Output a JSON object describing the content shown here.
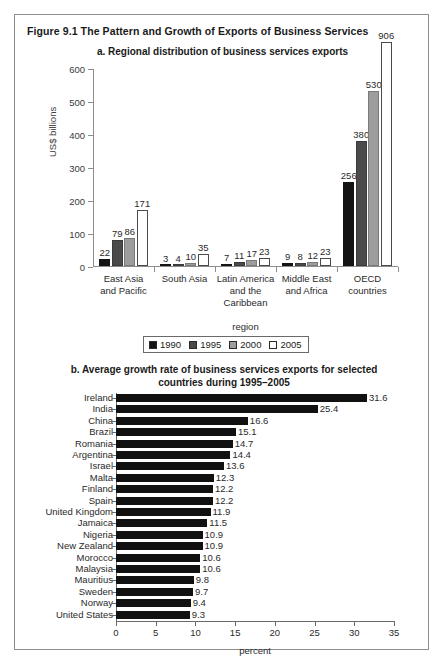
{
  "figure": {
    "title": "Figure 9.1  The Pattern and Growth of Exports of Business Services"
  },
  "panel_a": {
    "title": "a. Regional distribution of business services exports",
    "xlabel": "region",
    "legend": [
      {
        "label": "1990",
        "color": "#141414"
      },
      {
        "label": "1995",
        "color": "#4a4a4a"
      },
      {
        "label": "2000",
        "color": "#9d9d9d"
      },
      {
        "label": "2005",
        "color": "#ffffff"
      }
    ]
  },
  "panel_b": {
    "title": "b. Average growth rate of business services exports for selected countries during 1995–2005",
    "xlabel": "percent"
  },
  "chart_data": [
    {
      "type": "bar",
      "id": "panel-a",
      "title": "a. Regional distribution of business services exports",
      "xlabel": "region",
      "ylabel": "US$ billions",
      "ylim": [
        0,
        600
      ],
      "yticks": [
        0,
        100,
        200,
        300,
        400,
        500,
        600
      ],
      "ytick_labels": [
        "0",
        "100",
        "200",
        "300",
        "400",
        "500",
        "600"
      ],
      "grid": false,
      "legend": [
        "1990",
        "1995",
        "2000",
        "2005"
      ],
      "legend_position": "below-axis-center",
      "orientation": "vertical",
      "categories": [
        "East Asia and Pacific",
        "South Asia",
        "Latin America and the Caribbean",
        "Middle East and Africa",
        "OECD countries"
      ],
      "category_lines": [
        [
          "East Asia",
          "and Pacific"
        ],
        [
          "South Asia"
        ],
        [
          "Latin America",
          "and the",
          "Caribbean"
        ],
        [
          "Middle East",
          "and Africa"
        ],
        [
          "OECD",
          "countries"
        ]
      ],
      "series": [
        {
          "name": "1990",
          "color": "#141414",
          "values": [
            22,
            3,
            7,
            9,
            256
          ]
        },
        {
          "name": "1995",
          "color": "#4a4a4a",
          "values": [
            79,
            4,
            11,
            8,
            380
          ]
        },
        {
          "name": "2000",
          "color": "#9d9d9d",
          "values": [
            86,
            10,
            17,
            12,
            530
          ]
        },
        {
          "name": "2005",
          "color": "#ffffff",
          "values": [
            171,
            35,
            23,
            23,
            906
          ]
        }
      ],
      "note": "The 2005 OECD bar value 906 exceeds the 600 axis maximum and is drawn extending past the plot top."
    },
    {
      "type": "bar",
      "id": "panel-b",
      "title": "b. Average growth rate of business services exports for selected countries during 1995–2005",
      "xlabel": "percent",
      "ylabel": "",
      "xlim": [
        0,
        35
      ],
      "xticks": [
        0,
        5,
        10,
        15,
        20,
        25,
        30,
        35
      ],
      "xtick_labels": [
        "0",
        "5",
        "10",
        "15",
        "20",
        "25",
        "30",
        "35"
      ],
      "grid": false,
      "orientation": "horizontal",
      "bar_color": "#111111",
      "categories": [
        "Ireland",
        "India",
        "China",
        "Brazil",
        "Romania",
        "Argentina",
        "Israel",
        "Malta",
        "Finland",
        "Spain",
        "United Kingdom",
        "Jamaica",
        "Nigeria",
        "New Zealand",
        "Morocco",
        "Malaysia",
        "Mauritius",
        "Sweden",
        "Norway",
        "United States"
      ],
      "values": [
        31.6,
        25.4,
        16.6,
        15.1,
        14.7,
        14.4,
        13.6,
        12.3,
        12.2,
        12.2,
        11.9,
        11.5,
        10.9,
        10.9,
        10.6,
        10.6,
        9.8,
        9.7,
        9.4,
        9.3
      ],
      "value_labels": [
        "31.6",
        "25.4",
        "16.6",
        "15.1",
        "14.7",
        "14.4",
        "13.6",
        "12.3",
        "12.2",
        "12.2",
        "11.9",
        "11.5",
        "10.9",
        "10.9",
        "10.6",
        "10.6",
        "9.8",
        "9.7",
        "9.4",
        "9.3"
      ]
    }
  ]
}
